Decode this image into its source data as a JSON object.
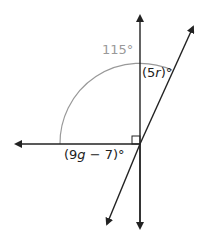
{
  "diagram": {
    "labels": {
      "outer_angle": "115°",
      "angle_r_open": "(5",
      "angle_r_var": "r",
      "angle_r_close": ")°",
      "angle_g_open": "(9",
      "angle_g_var": "g",
      "angle_g_close": " − 7)°"
    },
    "colors": {
      "line": "#222222",
      "arc": "#999999",
      "arc_label": "#999999"
    }
  }
}
